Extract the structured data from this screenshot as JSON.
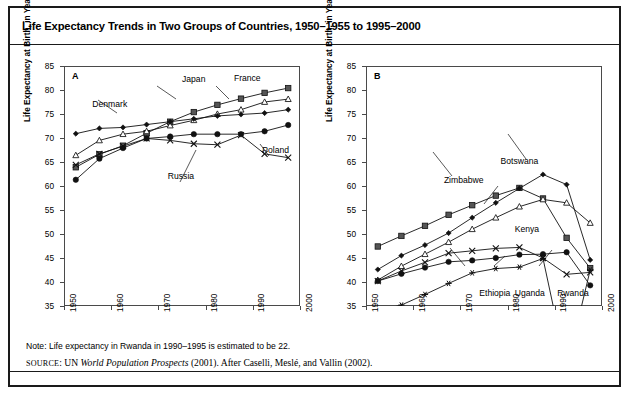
{
  "figure": {
    "title": "Life Expectancy Trends in Two Groups of Countries, 1950–1955 to 1995–2000",
    "note": "Note: Life expectancy in Rwanda in 1990–1995 is estimated to be 22.",
    "source_prefix": "SOURCE",
    "source_rest_a": ": UN ",
    "source_italic": "World Population Prospects",
    "source_rest_b": " (2001). After Caselli, Meslé, and Vallin (2002).",
    "frame_color": "#1a1a1a",
    "ink_color": "#000000"
  },
  "chart_data": [
    {
      "type": "line",
      "panel_letter": "A",
      "title": "Industrialized countries",
      "xlabel": "",
      "ylabel": "Life Expectancy at Birth, in Years",
      "xlim": [
        1950,
        2000
      ],
      "ylim": [
        35,
        85
      ],
      "yticks": [
        35,
        40,
        45,
        50,
        55,
        60,
        65,
        70,
        75,
        80,
        85
      ],
      "xticks": [
        1950,
        1960,
        1970,
        1980,
        1990,
        2000
      ],
      "xtick_labels": [
        "1950",
        "1960",
        "1970",
        "1980",
        "1990",
        "2000"
      ],
      "grid": false,
      "legend": "annotations",
      "x": [
        1952.5,
        1957.5,
        1962.5,
        1967.5,
        1972.5,
        1977.5,
        1982.5,
        1987.5,
        1992.5,
        1997.5
      ],
      "series": [
        {
          "name": "Japan",
          "marker": "filled-square",
          "values": [
            63.9,
            66.6,
            68.4,
            71.0,
            73.4,
            75.4,
            76.9,
            78.2,
            79.4,
            80.4
          ]
        },
        {
          "name": "France",
          "marker": "open-triangle",
          "values": [
            66.4,
            69.5,
            70.8,
            71.4,
            72.6,
            73.7,
            75.0,
            75.9,
            77.5,
            78.1
          ]
        },
        {
          "name": "Denmark",
          "marker": "small-diamond",
          "values": [
            70.9,
            72.0,
            72.2,
            72.8,
            73.4,
            74.0,
            74.6,
            74.9,
            75.2,
            75.9
          ]
        },
        {
          "name": "Poland",
          "marker": "filled-circle",
          "values": [
            61.3,
            65.7,
            67.9,
            69.9,
            70.3,
            70.8,
            70.8,
            70.8,
            71.4,
            72.7
          ]
        },
        {
          "name": "Russia",
          "marker": "cross-x",
          "values": [
            64.4,
            66.7,
            68.3,
            69.9,
            69.5,
            68.8,
            68.6,
            70.6,
            66.7,
            65.9
          ]
        }
      ],
      "annotations": [
        {
          "label": "Japan",
          "x": 1975,
          "y": 82.3
        },
        {
          "label": "France",
          "x": 1986,
          "y": 82.5
        },
        {
          "label": "Denmark",
          "x": 1956,
          "y": 77.0
        },
        {
          "label": "Poland",
          "x": 1992,
          "y": 67.5
        },
        {
          "label": "Russia",
          "x": 1972,
          "y": 62.0
        }
      ]
    },
    {
      "type": "line",
      "panel_letter": "B",
      "title": "Sub-Saharan African countries",
      "xlabel": "",
      "ylabel": "Life Expectancy at Birth, in Years",
      "xlim": [
        1950,
        2000
      ],
      "ylim": [
        35,
        85
      ],
      "yticks": [
        35,
        40,
        45,
        50,
        55,
        60,
        65,
        70,
        75,
        80,
        85
      ],
      "xticks": [
        1950,
        1960,
        1970,
        1980,
        1990,
        2000
      ],
      "xtick_labels": [
        "1950",
        "1960",
        "1970",
        "1980",
        "1990",
        "2000"
      ],
      "grid": false,
      "legend": "annotations",
      "x": [
        1952.5,
        1957.5,
        1962.5,
        1967.5,
        1972.5,
        1977.5,
        1982.5,
        1987.5,
        1992.5,
        1997.5
      ],
      "series": [
        {
          "name": "Zimbabwe",
          "marker": "filled-square",
          "values": [
            47.4,
            49.6,
            51.7,
            54.0,
            56.0,
            58.0,
            59.6,
            57.4,
            49.2,
            42.9
          ]
        },
        {
          "name": "Botswana",
          "marker": "small-diamond",
          "values": [
            42.6,
            45.5,
            47.7,
            50.2,
            53.4,
            56.5,
            59.5,
            62.4,
            60.3,
            44.6
          ]
        },
        {
          "name": "Kenya",
          "marker": "open-triangle",
          "values": [
            40.4,
            43.3,
            45.8,
            48.3,
            51.0,
            53.4,
            55.7,
            57.2,
            56.5,
            52.3
          ]
        },
        {
          "name": "Uganda",
          "marker": "cross-x",
          "values": [
            40.2,
            42.3,
            44.1,
            46.0,
            46.5,
            47.0,
            47.2,
            45.0,
            41.6,
            42.0
          ]
        },
        {
          "name": "Ethiopia",
          "marker": "filled-circle",
          "values": [
            40.2,
            41.7,
            43.0,
            44.2,
            44.5,
            45.0,
            45.7,
            45.8,
            46.2,
            39.3
          ]
        },
        {
          "name": "Rwanda",
          "marker": "star-asterisk",
          "values": [
            34.0,
            35.2,
            37.4,
            39.7,
            41.9,
            42.8,
            43.1,
            44.9,
            22.0,
            42.5
          ]
        }
      ],
      "annotations": [
        {
          "label": "Botswana",
          "x": 1978.5,
          "y": 65.2
        },
        {
          "label": "Zimbabwe",
          "x": 1966.5,
          "y": 61.2
        },
        {
          "label": "Kenya",
          "x": 1981.5,
          "y": 51.0
        },
        {
          "label": "Ethiopia",
          "x": 1974.0,
          "y": 37.7
        },
        {
          "label": "Uganda",
          "x": 1981.5,
          "y": 37.7
        },
        {
          "label": "Rwanda",
          "x": 1990.5,
          "y": 37.7
        }
      ]
    }
  ]
}
